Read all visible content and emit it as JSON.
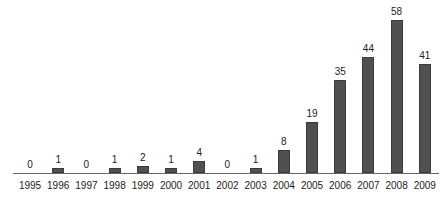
{
  "chart_data": {
    "type": "bar",
    "title": "",
    "xlabel": "",
    "ylabel": "",
    "categories": [
      "1995",
      "1996",
      "1997",
      "1998",
      "1999",
      "2000",
      "2001",
      "2002",
      "2003",
      "2004",
      "2005",
      "2006",
      "2007",
      "2008",
      "2009"
    ],
    "values": [
      0,
      1,
      0,
      1,
      2,
      1,
      4,
      0,
      1,
      8,
      19,
      35,
      44,
      58,
      41
    ],
    "ylim": [
      0,
      60
    ],
    "grid": false,
    "legend": null,
    "data_labels": true,
    "bar_color": "#505050"
  }
}
